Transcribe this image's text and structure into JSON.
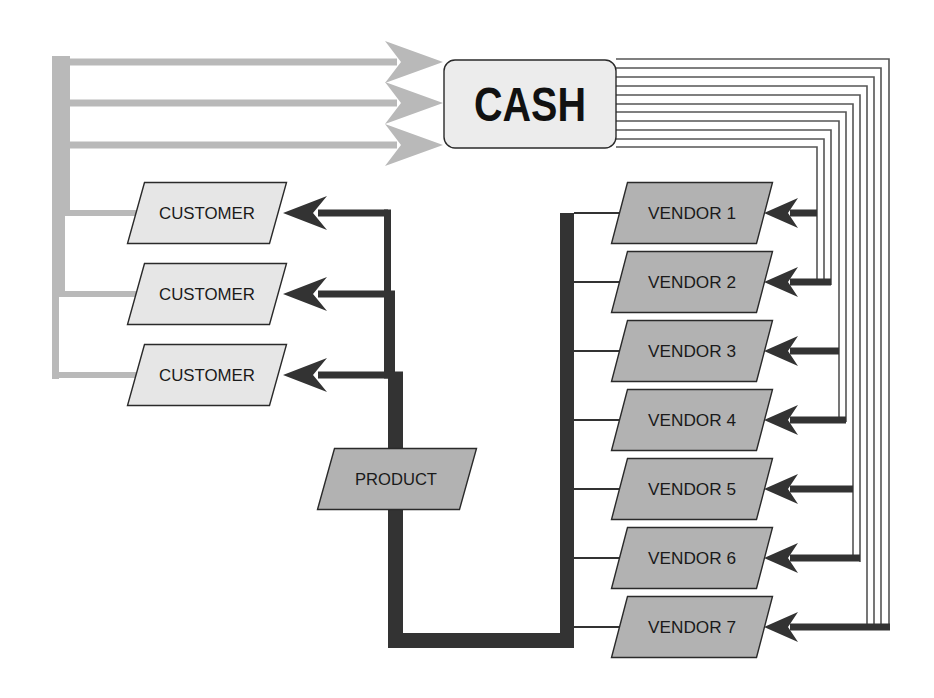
{
  "colors": {
    "background": "#ffffff",
    "cash_fill": "#ececec",
    "customer_fill": "#e6e6e6",
    "vendor_fill": "#b2b2b2",
    "product_fill": "#b2b2b2",
    "box_stroke": "#2a2a2a",
    "cash_flow": "#b9b9b9",
    "product_flow": "#333333",
    "payment_line": "#555555"
  },
  "cash": {
    "label": "CASH",
    "x": 444,
    "y": 60,
    "w": 172,
    "h": 88,
    "r": 11,
    "incoming_arrows_y": [
      62,
      103,
      145
    ]
  },
  "customers": [
    {
      "label": "CUSTOMER",
      "cy": 213
    },
    {
      "label": "CUSTOMER",
      "cy": 294
    },
    {
      "label": "CUSTOMER",
      "cy": 375
    }
  ],
  "product": {
    "label": "PRODUCT",
    "cy": 479
  },
  "vendors": [
    {
      "label": "VENDOR 1",
      "cy": 213
    },
    {
      "label": "VENDOR 2",
      "cy": 282
    },
    {
      "label": "VENDOR 3",
      "cy": 351
    },
    {
      "label": "VENDOR 4",
      "cy": 420
    },
    {
      "label": "VENDOR 5",
      "cy": 489
    },
    {
      "label": "VENDOR 6",
      "cy": 558
    },
    {
      "label": "VENDOR 7",
      "cy": 627
    }
  ],
  "payment_lines": {
    "count": 11,
    "x_positions": [
      817,
      824,
      831,
      839,
      846,
      853,
      860,
      867,
      874,
      881,
      889
    ],
    "y_positions": [
      147,
      139,
      130,
      121,
      112,
      104,
      95,
      86,
      77,
      68,
      59
    ],
    "end_y": [
      283,
      283,
      285,
      420,
      422,
      558,
      562,
      627,
      627,
      627,
      627
    ]
  },
  "vendor_arrows": [
    {
      "vendor": "VENDOR 1",
      "from_x": 817
    },
    {
      "vendor": "VENDOR 2",
      "from_x": 831
    },
    {
      "vendor": "VENDOR 3",
      "from_x": 839
    },
    {
      "vendor": "VENDOR 4",
      "from_x": 846
    },
    {
      "vendor": "VENDOR 5",
      "from_x": 853
    },
    {
      "vendor": "VENDOR 6",
      "from_x": 860
    },
    {
      "vendor": "VENDOR 7",
      "from_x": 890
    }
  ]
}
